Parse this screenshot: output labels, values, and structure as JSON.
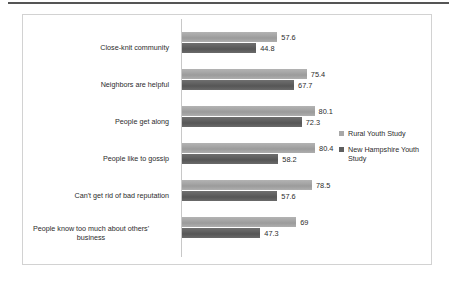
{
  "chart_data": {
    "type": "bar",
    "orientation": "horizontal",
    "title": "",
    "subtitle": "",
    "xlabel": "",
    "ylabel": "",
    "xlim": [
      0,
      100
    ],
    "grid": false,
    "legend_position": "right",
    "categories": [
      "Close-knit community",
      "Neighbors are helpful",
      "People get along",
      "People like to gossip",
      "Can't get rid of bad reputation",
      "People know too much about others'\nbusiness"
    ],
    "series": [
      {
        "name": "Rural Youth Study",
        "color": "#a8a8a8",
        "values": [
          57.6,
          75.4,
          80.1,
          80.4,
          78.5,
          69
        ],
        "labels": [
          "57.6",
          "75.4",
          "80.1",
          "80.4",
          "78.5",
          "69"
        ]
      },
      {
        "name": "New Hampshire Youth Study",
        "color": "#5e5e5e",
        "values": [
          44.8,
          67.7,
          72.3,
          58.2,
          57.6,
          47.3
        ],
        "labels": [
          "44.8",
          "67.7",
          "72.3",
          "58.2",
          "57.6",
          "47.3"
        ]
      }
    ]
  },
  "legend": {
    "items": [
      {
        "label": "Rural Youth Study",
        "swatch": "light"
      },
      {
        "label": "New Hampshire Youth Study",
        "swatch": "dark"
      }
    ]
  },
  "colors": {
    "series_light": "#a8a8a8",
    "series_dark": "#5e5e5e",
    "border": "#d2d2d2",
    "axis": "#c8c8c8",
    "text": "#2b2b2b",
    "rule": "#555555"
  }
}
